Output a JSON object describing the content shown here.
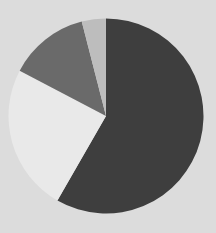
{
  "chart_data": {
    "type": "pie",
    "title": "",
    "categories": [
      "Slice A",
      "Slice B",
      "Slice C",
      "Slice D"
    ],
    "values": [
      58.3,
      24.4,
      13.3,
      4.0
    ],
    "colors": [
      "#3e3e3e",
      "#e9e9e9",
      "#6a6a6a",
      "#bdbdbd"
    ],
    "start_angle_deg": 0,
    "direction": "clockwise",
    "legend": "none",
    "labels_shown": false
  },
  "background_color": "#dcdcdc",
  "geometry": {
    "cx": 106,
    "cy": 116,
    "r": 97.5
  }
}
